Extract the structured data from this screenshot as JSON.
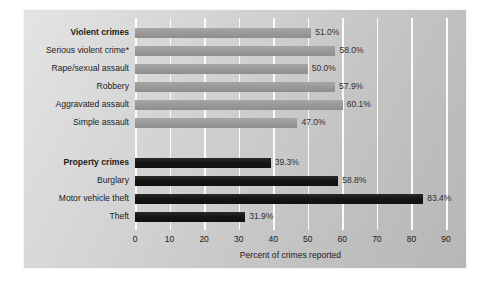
{
  "chart_data": {
    "type": "bar",
    "orientation": "horizontal",
    "title": "",
    "xlabel": "Percent of crimes reported",
    "ylabel": "",
    "xlim": [
      0,
      90
    ],
    "xticks": [
      0,
      10,
      20,
      30,
      40,
      50,
      60,
      70,
      80,
      90
    ],
    "xtick_labels": [
      "0",
      "10",
      "20",
      "30",
      "40",
      "50",
      "60",
      "70",
      "80",
      "90"
    ],
    "grid": true,
    "legend": "none",
    "value_label_suffix": "%",
    "groups": [
      {
        "name": "violent",
        "color": "#999999",
        "categories": [
          "Violent crimes",
          "Serious violent crime*",
          "Rape/sexual assault",
          "Robbery",
          "Aggravated assault",
          "Simple assault"
        ],
        "values": [
          51.0,
          58.0,
          50.0,
          57.9,
          60.1,
          47.0
        ],
        "value_labels": [
          "51.0%",
          "58.0%",
          "50.0%",
          "57.9%",
          "60.1%",
          "47.0%"
        ],
        "bold_rows": [
          true,
          false,
          false,
          false,
          false,
          false
        ]
      },
      {
        "name": "property",
        "color": "#161616",
        "categories": [
          "Property crimes",
          "Burglary",
          "Motor vehicle theft",
          "Theft"
        ],
        "values": [
          39.3,
          58.8,
          83.4,
          31.9
        ],
        "value_labels": [
          "39.3%",
          "58.8%",
          "83.4%",
          "31.9%"
        ],
        "bold_rows": [
          true,
          false,
          false,
          false
        ]
      }
    ]
  }
}
